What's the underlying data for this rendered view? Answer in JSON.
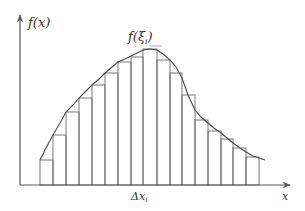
{
  "diagram": {
    "labels": {
      "y_axis": "f(x)",
      "sample_value": "f(ξ",
      "sample_sub": "i",
      "sample_close": ")",
      "delta": "Δx",
      "delta_sub": "i",
      "x_axis": "x"
    },
    "colors": {
      "axis": "#5a5a5a",
      "bars": "#6a6a6a",
      "curve": "#4a4a4a"
    },
    "baseline_y": 185,
    "bars": [
      {
        "x0": 40,
        "x1": 53,
        "top": 160
      },
      {
        "x0": 53,
        "x1": 66,
        "top": 135
      },
      {
        "x0": 66,
        "x1": 79,
        "top": 112
      },
      {
        "x0": 79,
        "x1": 92,
        "top": 98
      },
      {
        "x0": 92,
        "x1": 105,
        "top": 85
      },
      {
        "x0": 105,
        "x1": 118,
        "top": 73
      },
      {
        "x0": 118,
        "x1": 131,
        "top": 62
      },
      {
        "x0": 131,
        "x1": 143,
        "top": 57
      },
      {
        "x0": 143,
        "x1": 157,
        "top": 49
      },
      {
        "x0": 157,
        "x1": 170,
        "top": 60
      },
      {
        "x0": 170,
        "x1": 182,
        "top": 73
      },
      {
        "x0": 182,
        "x1": 195,
        "top": 95
      },
      {
        "x0": 195,
        "x1": 208,
        "top": 120
      },
      {
        "x0": 208,
        "x1": 221,
        "top": 131
      },
      {
        "x0": 221,
        "x1": 233,
        "top": 139
      },
      {
        "x0": 233,
        "x1": 246,
        "top": 148
      },
      {
        "x0": 246,
        "x1": 259,
        "top": 157
      }
    ],
    "curve_points": [
      [
        40,
        160
      ],
      [
        46,
        148
      ],
      [
        53,
        135
      ],
      [
        60,
        123
      ],
      [
        66,
        112
      ],
      [
        73,
        105
      ],
      [
        79,
        98
      ],
      [
        86,
        91
      ],
      [
        92,
        85
      ],
      [
        99,
        79
      ],
      [
        105,
        73
      ],
      [
        112,
        67
      ],
      [
        118,
        62
      ],
      [
        125,
        59
      ],
      [
        131,
        56
      ],
      [
        137,
        53
      ],
      [
        143,
        50
      ],
      [
        150,
        49
      ],
      [
        157,
        50
      ],
      [
        163,
        54
      ],
      [
        170,
        60
      ],
      [
        176,
        67
      ],
      [
        182,
        78
      ],
      [
        188,
        95
      ],
      [
        195,
        110
      ],
      [
        201,
        117
      ],
      [
        208,
        123
      ],
      [
        214,
        128
      ],
      [
        221,
        133
      ],
      [
        227,
        138
      ],
      [
        233,
        143
      ],
      [
        240,
        148
      ],
      [
        246,
        152
      ],
      [
        253,
        156
      ],
      [
        265,
        160
      ]
    ]
  }
}
